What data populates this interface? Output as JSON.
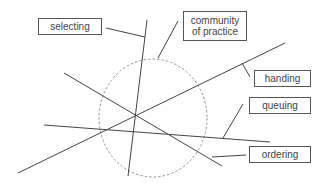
{
  "diagram": {
    "labels": {
      "selecting": "selecting",
      "community_line1": "community",
      "community_line2": "of practice",
      "handing": "handing",
      "queuing": "queuing",
      "ordering": "ordering"
    },
    "colors": {
      "line": "#444444",
      "circle": "#888888",
      "box_border": "#555555",
      "text": "#444444"
    },
    "circle": {
      "cx": 153,
      "cy": 118,
      "rx": 54,
      "ry": 59,
      "style": "dashed"
    },
    "lines": [
      {
        "name": "selecting-line",
        "x1": 147,
        "y1": 20,
        "x2": 128,
        "y2": 176
      },
      {
        "name": "ordering-line",
        "x1": 64,
        "y1": 73,
        "x2": 222,
        "y2": 166
      },
      {
        "name": "handing-line",
        "x1": 18,
        "y1": 173,
        "x2": 285,
        "y2": 43
      },
      {
        "name": "queuing-line",
        "x1": 44,
        "y1": 125,
        "x2": 270,
        "y2": 142
      }
    ],
    "connectors": [
      {
        "name": "selecting-connector",
        "x1": 106,
        "y1": 28,
        "x2": 145,
        "y2": 37
      },
      {
        "name": "community-connector",
        "x1": 158,
        "y1": 58,
        "x2": 178,
        "y2": 21
      },
      {
        "name": "handing-connector",
        "x1": 242,
        "y1": 63,
        "x2": 250,
        "y2": 77
      },
      {
        "name": "queuing-connector",
        "x1": 223,
        "y1": 138,
        "x2": 243,
        "y2": 104
      },
      {
        "name": "ordering-connector",
        "x1": 212,
        "y1": 157,
        "x2": 246,
        "y2": 155
      }
    ]
  }
}
